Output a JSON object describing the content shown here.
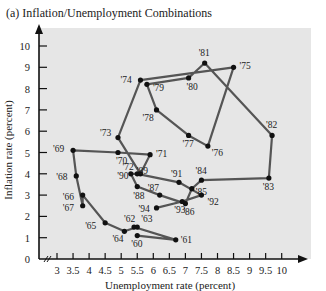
{
  "title": "(a) Inflation/Unemployment Combinations",
  "chart_data": {
    "type": "line",
    "title": "(a) Inflation/Unemployment Combinations",
    "xlabel": "Unemployment rate (percent)",
    "ylabel": "Inflation rate (percent)",
    "xticks": [
      "3",
      "3.5",
      "4",
      "4.5",
      "5",
      "5.5",
      "6",
      "6.5",
      "7",
      "7.5",
      "8",
      "8.5",
      "9",
      "9.5",
      "10"
    ],
    "yticks": [
      "0",
      "1",
      "2",
      "3",
      "4",
      "5",
      "6",
      "7",
      "8",
      "9",
      "10"
    ],
    "xlim": [
      2.8,
      10.5
    ],
    "ylim": [
      0,
      10.5
    ],
    "grid": false,
    "background": "#e6e6e6",
    "line_color": "#555555",
    "point_color": "#111111",
    "points": [
      {
        "year": "'61",
        "x": 6.7,
        "y": 0.9
      },
      {
        "year": "'60",
        "x": 5.5,
        "y": 1.1
      },
      {
        "year": "'62",
        "x": 5.4,
        "y": 1.5
      },
      {
        "year": "'63",
        "x": 5.5,
        "y": 1.5
      },
      {
        "year": "'64",
        "x": 5.1,
        "y": 1.3
      },
      {
        "year": "'65",
        "x": 4.5,
        "y": 1.7
      },
      {
        "year": "'66",
        "x": 3.8,
        "y": 3.0
      },
      {
        "year": "'67",
        "x": 3.8,
        "y": 2.5
      },
      {
        "year": "'68",
        "x": 3.6,
        "y": 3.9
      },
      {
        "year": "'69",
        "x": 3.5,
        "y": 5.1
      },
      {
        "year": "'70",
        "x": 4.9,
        "y": 5.0
      },
      {
        "year": "'71",
        "x": 5.9,
        "y": 4.9
      },
      {
        "year": "'72",
        "x": 5.6,
        "y": 4.0
      },
      {
        "year": "'73",
        "x": 4.9,
        "y": 5.7
      },
      {
        "year": "'74",
        "x": 5.6,
        "y": 8.4
      },
      {
        "year": "'75",
        "x": 8.5,
        "y": 9.0
      },
      {
        "year": "'76",
        "x": 7.7,
        "y": 5.3
      },
      {
        "year": "'77",
        "x": 7.1,
        "y": 5.8
      },
      {
        "year": "'78",
        "x": 6.1,
        "y": 7.0
      },
      {
        "year": "'79",
        "x": 5.8,
        "y": 8.2
      },
      {
        "year": "'80",
        "x": 7.1,
        "y": 8.5
      },
      {
        "year": "'81",
        "x": 7.6,
        "y": 9.2
      },
      {
        "year": "'82",
        "x": 9.7,
        "y": 5.8
      },
      {
        "year": "'83",
        "x": 9.6,
        "y": 3.8
      },
      {
        "year": "'84",
        "x": 7.5,
        "y": 3.7
      },
      {
        "year": "'85",
        "x": 7.2,
        "y": 3.3
      },
      {
        "year": "'86",
        "x": 7.0,
        "y": 2.6
      },
      {
        "year": "'87",
        "x": 6.2,
        "y": 3.0
      },
      {
        "year": "'88",
        "x": 5.5,
        "y": 3.4
      },
      {
        "year": "'89",
        "x": 5.3,
        "y": 4.0
      },
      {
        "year": "'90",
        "x": 5.5,
        "y": 4.0
      },
      {
        "year": "'91",
        "x": 6.8,
        "y": 3.6
      },
      {
        "year": "'92",
        "x": 7.5,
        "y": 3.0
      },
      {
        "year": "'93",
        "x": 6.9,
        "y": 2.7
      },
      {
        "year": "'94",
        "x": 6.1,
        "y": 2.4
      }
    ]
  }
}
